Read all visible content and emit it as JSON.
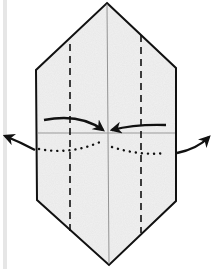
{
  "diagram": {
    "colors": {
      "paper_fill": "#f1f1f1",
      "outline": "#111111",
      "crease": "#888888",
      "side_bar": "#e6e6e6"
    },
    "elements": [
      {
        "name": "paper-shape",
        "type": "elongated hexagon"
      },
      {
        "name": "center-crease",
        "type": "thin vertical line"
      },
      {
        "name": "left-valley-fold",
        "type": "dashed vertical line"
      },
      {
        "name": "right-valley-fold",
        "type": "dashed vertical line"
      },
      {
        "name": "horizontal-crease",
        "type": "thin horizontal line"
      },
      {
        "name": "fold-arrow-left-to-center",
        "type": "curved arrow"
      },
      {
        "name": "fold-arrow-right-to-center",
        "type": "curved arrow"
      },
      {
        "name": "dotted-hidden-edge",
        "type": "dotted curve"
      },
      {
        "name": "unfold-arrow-left",
        "type": "curved arrow outward"
      },
      {
        "name": "unfold-arrow-right",
        "type": "curved arrow outward"
      }
    ]
  }
}
